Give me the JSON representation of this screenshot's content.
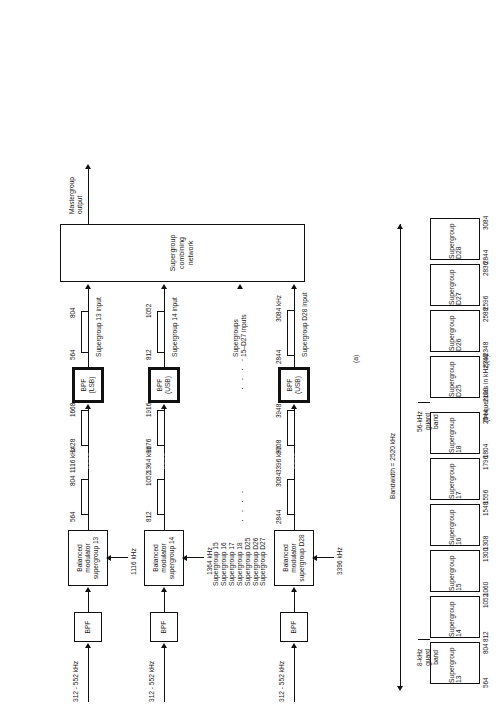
{
  "figure": {
    "part_a_caption": "(a)",
    "part_b_caption": "(b)",
    "units_note": "(frequencies in kHz)"
  },
  "diagram_a": {
    "combining_network_label": "Supergroup\ncombining\nnetwork",
    "mastergroup_output_label": "Mastergroup\noutput",
    "supergroups_15_d27_label": "Supergroups\n15–D27 inputs",
    "unlisted_supergroups": [
      "Supergroup 15",
      "Supergroup 16",
      "Supergroup 17",
      "Supergroup 18",
      "Supergroup D25",
      "Supergroup D26",
      "Supergroup D27"
    ],
    "channels": [
      {
        "input_label": "312 - 552 kHz",
        "bpf_label": "BPF",
        "modulator_label": "Balanced\nmodulator\nsupergroup 13",
        "carrier_label": "1116 kHz",
        "carrier_tick_label": "1116 kHz",
        "lsb_low": "564",
        "lsb_high": "804",
        "usb_low": "1428",
        "usb_high": "1668",
        "filter_label": "BPF\n(LSB)",
        "out_low": "564",
        "out_high": "804",
        "out_label": "Supergroup 13 input"
      },
      {
        "input_label": "312 - 552 kHz",
        "bpf_label": "BPF",
        "modulator_label": "Balanced\nmodulator\nsupergroup 14",
        "carrier_label": "1364 kHz",
        "carrier_tick_label": "1364 kHz",
        "lsb_low": "812",
        "lsb_high": "1052",
        "usb_low": "1676",
        "usb_high": "1916",
        "filter_label": "BPF\n(USB)",
        "out_low": "812",
        "out_high": "1052",
        "out_label": "Supergroup 14 input"
      },
      {
        "input_label": "312 - 552 kHz",
        "bpf_label": "BPF",
        "modulator_label": "Balanced\nmodulator\nsupergroup D28",
        "carrier_label": "3396 kHz",
        "carrier_tick_label": "3396 kHz",
        "lsb_low": "2844",
        "lsb_high": "3084",
        "usb_low": "3708",
        "usb_high": "3948",
        "filter_label": "BPF\n(USB)",
        "out_low": "2844",
        "out_high": "3084 kHz",
        "out_label": "Supergroup D28 input"
      }
    ]
  },
  "spectrum_b": {
    "bandwidth_label": "Bandwidth = 2520 kHz",
    "guard_8k_label": "8-kHz\nguard\nband",
    "guard_56k_label": "56-kHz\nguard\nband",
    "ellipsis": "· · · ·",
    "bands": [
      {
        "name": "Supergroup 13",
        "low": "564",
        "high": "804"
      },
      {
        "name": "Supergroup 14",
        "low": "812",
        "high": "1052"
      },
      {
        "name": "Supergroup 15",
        "low": "1060",
        "high": "1300"
      },
      {
        "name": "Supergroup 16",
        "low": "1308",
        "high": "1548"
      },
      {
        "name": "Supergroup 17",
        "low": "1556",
        "high": "1796"
      },
      {
        "name": "Supergroup 18",
        "low": "1804",
        "high": "2044"
      },
      {
        "name": "Supergroup D25",
        "low": "2100",
        "high": "2340"
      },
      {
        "name": "Supergroup D26",
        "low": "2348",
        "high": "2588"
      },
      {
        "name": "Supergroup D27",
        "low": "2596",
        "high": "2836"
      },
      {
        "name": "Supergroup D28",
        "low": "2844",
        "high": "3084"
      }
    ]
  }
}
